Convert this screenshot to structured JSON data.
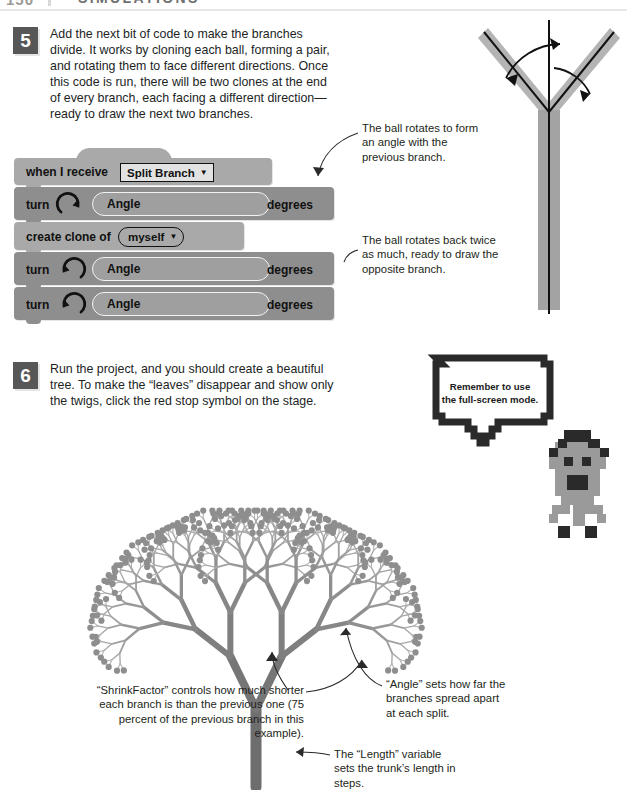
{
  "header": {
    "folio": "150",
    "chapter": "SIMULATIONS"
  },
  "steps": [
    {
      "number": "5",
      "text": "Add the next bit of code to make the branches divide. It works by cloning each ball, forming a pair, and rotating them to face different directions. Once this code is run, there will be two clones at the end of every branch, each facing a different direction—ready to draw the next two branches."
    },
    {
      "number": "6",
      "text": "Run the project, and you should create a beautiful tree. To make the “leaves” disappear and show only the twigs, click the red stop symbol on the stage."
    }
  ],
  "script": {
    "hat": {
      "label": "when I receive",
      "dropdown_value": "Split Branch",
      "caret": "▼"
    },
    "blocks": [
      {
        "id": "turn-right",
        "label": "turn",
        "icon": "turn-clockwise-icon",
        "input_value": "Angle",
        "units": "degrees"
      },
      {
        "id": "create-clone",
        "label": "create clone of",
        "dropdown_value": "myself",
        "caret": "▼"
      },
      {
        "id": "turn-left-1",
        "label": "turn",
        "icon": "turn-counterclockwise-icon",
        "input_value": "Angle",
        "units": "degrees"
      },
      {
        "id": "turn-left-2",
        "label": "turn",
        "icon": "turn-counterclockwise-icon",
        "input_value": "Angle",
        "units": "degrees"
      }
    ]
  },
  "callouts": {
    "ball_rotates": "The ball rotates to form an angle with the previous branch.",
    "ball_rotates_back": "The ball rotates back twice as much, ready to draw the opposite branch.",
    "shrink_factor": "“ShrinkFactor” controls how much shorter each branch is than the previous one (75 percent of the previous branch in this example).",
    "angle_variable": "“Angle” sets how far the branches spread apart at each split.",
    "length_variable": "The “Length” variable sets the trunk’s length in steps."
  },
  "speech_bubble": {
    "line1": "Remember to use",
    "line2": "the full-screen mode."
  },
  "colors": {
    "page_background": "#ffffff",
    "block_dark": "#8e8e8e",
    "block_light": "#a9a9a9",
    "step_badge": "#575757",
    "text": "#231f20",
    "tree_dark": "#6e6e6e",
    "tree_light": "#b9b9b9",
    "sprite_body": "#9a9a9a",
    "sprite_dark": "#3a3a3a"
  },
  "figures": {
    "branch_diagram": "v-branch-angle-diagram",
    "tree": "fractal-tree-illustration",
    "sprite": "pixel-character-icon"
  }
}
